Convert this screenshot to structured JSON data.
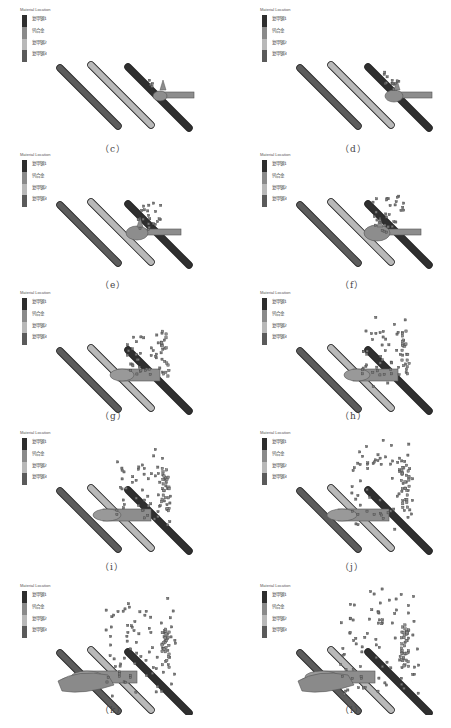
{
  "figure": {
    "legend": {
      "title": "Material Location",
      "items": [
        {
          "label": "复甲钢1",
          "color": "#2e2e2e"
        },
        {
          "label": "钨合金",
          "color": "#8a8a8a"
        },
        {
          "label": "复甲钢2",
          "color": "#b8b8b8"
        },
        {
          "label": "复甲钢3",
          "color": "#5a5a5a"
        }
      ]
    },
    "colors": {
      "plate_front": "#5c5c5c",
      "plate_middle": "#b9b9b9",
      "plate_back": "#2f2f2f",
      "projectile": "#8d8d8d",
      "debris": "#7a7a7a"
    },
    "panels": [
      {
        "id": "c",
        "caption": "（c）"
      },
      {
        "id": "d",
        "caption": "（d）"
      },
      {
        "id": "e",
        "caption": "（e）"
      },
      {
        "id": "f",
        "caption": "（f）"
      },
      {
        "id": "g",
        "caption": "（g）"
      },
      {
        "id": "h",
        "caption": "（h）"
      },
      {
        "id": "i",
        "caption": "（i）"
      },
      {
        "id": "j",
        "caption": "（j）"
      },
      {
        "id": "k",
        "caption": "（k）"
      },
      {
        "id": "l",
        "caption": "（l）"
      }
    ]
  }
}
